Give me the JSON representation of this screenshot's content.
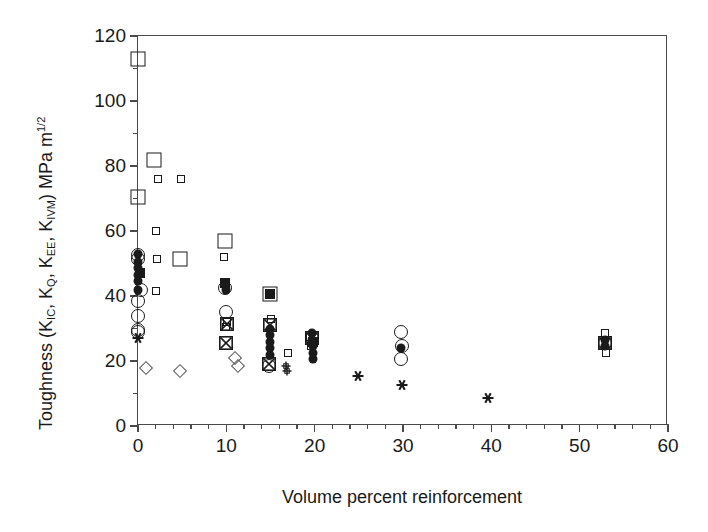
{
  "chart_data": {
    "type": "scatter",
    "title": "",
    "xlabel": "Volume percent reinforcement",
    "ylabel_plain": "Toughness (KIC, KQ, KEE, KIVM) MPa m1/2",
    "ylabel_parts": {
      "lead": "Toughness (K",
      "sub1": "IC",
      "mid1": ", K",
      "sub2": "Q",
      "mid2": ", K",
      "sub3": "EE",
      "mid3": ", K",
      "sub4": "IVM",
      "tail": ") MPa m",
      "sup": "1/2"
    },
    "xlim": [
      0,
      60
    ],
    "ylim": [
      0,
      120
    ],
    "x_major_ticks": [
      0,
      10,
      20,
      30,
      40,
      50,
      60
    ],
    "x_minor_step": 2,
    "y_major_ticks": [
      0,
      20,
      40,
      60,
      80,
      100,
      120
    ],
    "y_minor_step": 10,
    "xtick_labels": [
      "0",
      "10",
      "20",
      "30",
      "40",
      "50",
      "60"
    ],
    "ytick_labels": [
      "0",
      "20",
      "40",
      "60",
      "80",
      "100",
      "120"
    ],
    "grid": false,
    "legend": "none",
    "marker_styles": {
      "square-open-large": "large open square",
      "square-open-small": "small open square",
      "square-filled": "filled square",
      "square-x": "open square with X",
      "circle-open": "open circle",
      "circle-filled": "filled circle",
      "diamond-open": "open diamond",
      "asterisk": "asterisk / six-point star",
      "plus-open": "open plus"
    },
    "series": [
      {
        "name": "large open squares",
        "marker": "square-open-large",
        "size": 15,
        "points": [
          [
            0.0,
            113.0
          ],
          [
            1.8,
            82.0
          ],
          [
            0.0,
            70.5
          ],
          [
            4.8,
            51.5
          ],
          [
            9.8,
            57.0
          ],
          [
            14.9,
            40.5
          ]
        ]
      },
      {
        "name": "small open squares",
        "marker": "square-open-small",
        "size": 8,
        "points": [
          [
            2.3,
            76.0
          ],
          [
            4.9,
            76.0
          ],
          [
            2.0,
            60.0
          ],
          [
            2.2,
            51.5
          ],
          [
            2.0,
            41.5
          ],
          [
            9.7,
            52.0
          ],
          [
            10.1,
            32.0
          ],
          [
            10.0,
            30.5
          ],
          [
            15.0,
            33.0
          ],
          [
            17.0,
            22.5
          ],
          [
            19.5,
            27.5
          ],
          [
            19.6,
            24.5
          ],
          [
            52.9,
            28.5
          ],
          [
            53.0,
            22.5
          ]
        ]
      },
      {
        "name": "filled squares",
        "marker": "square-filled",
        "size": 10,
        "points": [
          [
            9.8,
            44.0
          ],
          [
            14.9,
            40.5
          ],
          [
            0.2,
            47.0
          ],
          [
            19.8,
            26.0
          ]
        ]
      },
      {
        "name": "squares with X",
        "marker": "square-x",
        "size": 14,
        "points": [
          [
            10.1,
            31.5
          ],
          [
            10.0,
            25.5
          ],
          [
            14.9,
            31.0
          ],
          [
            14.8,
            19.0
          ],
          [
            19.7,
            27.0
          ],
          [
            52.9,
            25.5
          ]
        ]
      },
      {
        "name": "open circles",
        "marker": "circle-open",
        "size": 14,
        "points": [
          [
            0.0,
            51.5
          ],
          [
            0.0,
            52.5
          ],
          [
            0.0,
            38.5
          ],
          [
            0.0,
            34.0
          ],
          [
            0.0,
            29.5
          ],
          [
            0.0,
            29.0
          ],
          [
            9.9,
            42.5
          ],
          [
            10.0,
            35.0
          ],
          [
            14.8,
            18.5
          ],
          [
            19.7,
            27.0
          ],
          [
            29.8,
            29.0
          ],
          [
            29.9,
            24.5
          ],
          [
            29.8,
            20.5
          ],
          [
            52.9,
            25.5
          ],
          [
            0.3,
            42.0
          ]
        ]
      },
      {
        "name": "filled circles",
        "marker": "circle-filled",
        "size": 9,
        "points": [
          [
            0.0,
            53.0
          ],
          [
            0.0,
            50.5
          ],
          [
            0.0,
            48.5
          ],
          [
            0.0,
            46.5
          ],
          [
            0.0,
            44.5
          ],
          [
            0.0,
            42.0
          ],
          [
            9.9,
            43.5
          ],
          [
            10.0,
            42.0
          ],
          [
            14.9,
            30.0
          ],
          [
            14.9,
            28.0
          ],
          [
            14.9,
            26.0
          ],
          [
            14.9,
            24.0
          ],
          [
            14.9,
            22.0
          ],
          [
            19.7,
            28.5
          ],
          [
            19.7,
            26.5
          ],
          [
            19.8,
            24.5
          ],
          [
            19.8,
            22.5
          ],
          [
            19.8,
            20.5
          ],
          [
            29.8,
            24.0
          ],
          [
            52.9,
            26.5
          ],
          [
            52.9,
            24.5
          ]
        ]
      },
      {
        "name": "open diamonds",
        "marker": "diamond-open",
        "size": 10,
        "points": [
          [
            0.9,
            18.0
          ],
          [
            4.7,
            17.0
          ],
          [
            11.0,
            21.0
          ],
          [
            11.3,
            18.5
          ]
        ]
      },
      {
        "name": "asterisks",
        "marker": "asterisk",
        "size": 11,
        "points": [
          [
            0.0,
            27.0
          ],
          [
            24.9,
            15.5
          ],
          [
            29.9,
            12.5
          ],
          [
            39.6,
            8.5
          ]
        ]
      },
      {
        "name": "open plus",
        "marker": "plus-open",
        "size": 9,
        "points": [
          [
            16.8,
            18.5
          ],
          [
            16.9,
            17.0
          ]
        ]
      }
    ]
  },
  "figure": {
    "background_color": "#ffffff",
    "axis_color": "#4a4a4a",
    "marker_color": "#1a1a1a"
  }
}
